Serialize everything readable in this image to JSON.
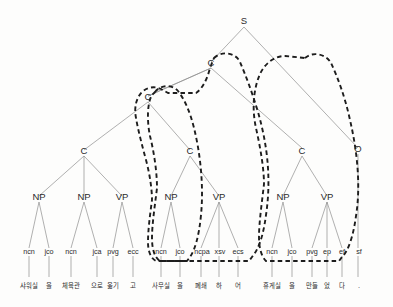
{
  "figure": {
    "name": "korean-dependency-parse-tree",
    "type": "constituency-tree",
    "root_label": "S"
  },
  "nodes": {
    "s": "S",
    "c_top": "C",
    "c_left": "C",
    "c_1": "C",
    "c_2": "C",
    "c_3": "C",
    "o": "O"
  },
  "phrases": [
    {
      "label": "NP"
    },
    {
      "label": "NP"
    },
    {
      "label": "VP"
    },
    {
      "label": "NP"
    },
    {
      "label": "VP"
    },
    {
      "label": "NP"
    },
    {
      "label": "VP"
    }
  ],
  "leaves": [
    {
      "pos": "ncn",
      "word": "샤워실"
    },
    {
      "pos": "jco",
      "word": "을"
    },
    {
      "pos": "ncn",
      "word": "체육관"
    },
    {
      "pos": "jca",
      "word": "으로"
    },
    {
      "pos": "pvg",
      "word": "옮기"
    },
    {
      "pos": "ecc",
      "word": "고"
    },
    {
      "pos": "ncn",
      "word": "사무실"
    },
    {
      "pos": "jco",
      "word": "을"
    },
    {
      "pos": "ncpa",
      "word": "폐쇄"
    },
    {
      "pos": "xsv",
      "word": "하"
    },
    {
      "pos": "ecs",
      "word": "어"
    },
    {
      "pos": "ncn",
      "word": "휴게실"
    },
    {
      "pos": "jco",
      "word": "을"
    },
    {
      "pos": "pvg",
      "word": "만들"
    },
    {
      "pos": "ep",
      "word": "었"
    },
    {
      "pos": "ef",
      "word": "다"
    },
    {
      "pos": "sf",
      "word": "."
    }
  ],
  "colors": {
    "edge": "#8e8e8e",
    "text": "#2b2b2b",
    "chunk_boundary": "#1d1d1d",
    "background": "#fdfdfc"
  }
}
